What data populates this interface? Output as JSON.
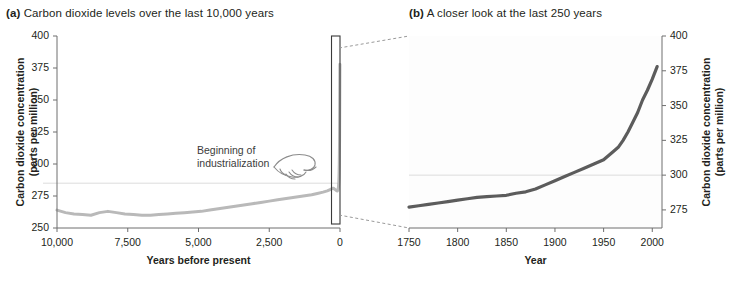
{
  "figure": {
    "panel_a": {
      "tag": "(a)",
      "title": "Carbon dioxide levels over the last 10,000 years",
      "annotation_line1": "Beginning of",
      "annotation_line2": "industrialization",
      "hand_icon": "pointing-hand-icon"
    },
    "panel_b": {
      "tag": "(b)",
      "title": "A closer look at the last 250 years"
    }
  },
  "chart_data": [
    {
      "id": "panel_a",
      "type": "line",
      "title": "Carbon dioxide levels over the last 10,000 years",
      "xlabel": "Years before present",
      "ylabel": "Carbon dioxide concentration (parts per million)",
      "ylabel_line1": "Carbon dioxide concentration",
      "ylabel_line2": "(parts per million)",
      "xlim": [
        10000,
        0
      ],
      "ylim": [
        250,
        400
      ],
      "x_reversed": true,
      "xticks": [
        10000,
        7500,
        5000,
        2500,
        0
      ],
      "xticklabels": [
        "10,000",
        "7,500",
        "5,000",
        "2,500",
        "0"
      ],
      "yticks": [
        250,
        275,
        300,
        325,
        350,
        375,
        400
      ],
      "yticklabels": [
        "250",
        "275",
        "300",
        "325",
        "350",
        "375",
        "400"
      ],
      "grid": false,
      "reference_line": 285,
      "line_color": "#b9b9b9",
      "series": [
        {
          "name": "Atmospheric CO2 (ice core record)",
          "x": [
            10000,
            9700,
            9400,
            9100,
            8800,
            8500,
            8200,
            7900,
            7600,
            7300,
            7000,
            6700,
            6400,
            6100,
            5800,
            5500,
            5200,
            4900,
            4600,
            4300,
            4000,
            3700,
            3400,
            3100,
            2800,
            2500,
            2200,
            1900,
            1600,
            1300,
            1000,
            800,
            600,
            450,
            350,
            300,
            260,
            230,
            200,
            170,
            140,
            110,
            90,
            70,
            55,
            45,
            35,
            25,
            15,
            8,
            3
          ],
          "values": [
            264,
            262,
            261,
            260.5,
            260,
            262,
            263,
            262,
            261,
            260.5,
            260,
            260,
            260.5,
            261,
            261.5,
            262,
            262.5,
            263,
            264,
            265,
            266,
            267,
            268,
            269,
            270,
            271,
            272,
            273,
            274,
            275,
            276,
            277,
            278,
            279,
            280,
            280.5,
            281,
            281,
            280.5,
            280,
            279.5,
            279,
            279,
            280,
            282,
            285,
            290,
            300,
            320,
            350,
            378
          ]
        }
      ],
      "callout_box": {
        "x_start": 300,
        "x_end": 0,
        "y_start": 250,
        "y_end": 400
      }
    },
    {
      "id": "panel_b",
      "type": "line",
      "title": "A closer look at the last 250 years",
      "xlabel": "Year",
      "ylabel": "Carbon dioxide concentration (parts per million)",
      "ylabel_line1": "Carbon dioxide concentration",
      "ylabel_line2": "(parts per million)",
      "xlim": [
        1750,
        2010
      ],
      "ylim": [
        262,
        400
      ],
      "xticks": [
        1750,
        1800,
        1850,
        1900,
        1950,
        2000
      ],
      "xticklabels": [
        "1750",
        "1800",
        "1850",
        "1900",
        "1950",
        "2000"
      ],
      "yticks": [
        275,
        300,
        325,
        350,
        375,
        400
      ],
      "yticklabels": [
        "275",
        "300",
        "325",
        "350",
        "375",
        "400"
      ],
      "grid": false,
      "reference_line": 300,
      "line_color": "#5c5c5c",
      "series": [
        {
          "name": "Atmospheric CO2",
          "x": [
            1750,
            1760,
            1770,
            1780,
            1790,
            1800,
            1810,
            1820,
            1830,
            1840,
            1850,
            1860,
            1870,
            1880,
            1890,
            1900,
            1910,
            1920,
            1930,
            1940,
            1950,
            1960,
            1965,
            1970,
            1975,
            1980,
            1985,
            1990,
            1995,
            2000,
            2005
          ],
          "values": [
            277,
            278,
            279,
            280,
            281,
            282,
            283,
            284,
            284.5,
            285,
            285.5,
            287,
            288,
            290,
            293,
            296,
            299,
            302,
            305,
            308,
            311,
            317,
            320,
            325,
            331,
            338,
            345,
            354,
            361,
            369,
            378
          ]
        }
      ]
    }
  ]
}
